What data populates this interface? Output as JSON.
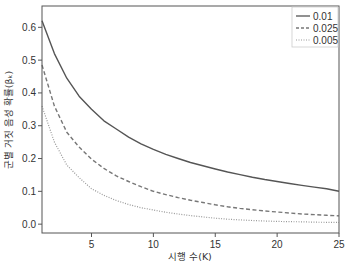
{
  "chart_data": {
    "type": "line",
    "title": "",
    "xlabel": "시행 수(K)",
    "ylabel": "군별 거짓 음성 확률(βₖ)",
    "xlim": [
      1,
      25
    ],
    "ylim": [
      -0.027,
      0.665
    ],
    "xticks": [
      5,
      10,
      15,
      20,
      25
    ],
    "yticks": [
      0.0,
      0.1,
      0.2,
      0.3,
      0.4,
      0.5,
      0.6
    ],
    "ytick_labels": [
      "0.0",
      "0.1",
      "0.2",
      "0.3",
      "0.4",
      "0.5",
      "0.6"
    ],
    "grid": false,
    "legend_position": "upper right",
    "x": [
      1,
      2,
      3,
      4,
      5,
      6,
      7,
      8,
      9,
      10,
      11,
      12,
      13,
      14,
      15,
      16,
      17,
      18,
      19,
      20,
      21,
      22,
      23,
      24,
      25
    ],
    "series": [
      {
        "name": "0.01",
        "style": "solid",
        "color": "#555555",
        "values": [
          0.62,
          0.52,
          0.445,
          0.39,
          0.35,
          0.315,
          0.29,
          0.265,
          0.245,
          0.228,
          0.213,
          0.2,
          0.188,
          0.178,
          0.168,
          0.159,
          0.151,
          0.143,
          0.136,
          0.13,
          0.124,
          0.118,
          0.113,
          0.108,
          0.1
        ]
      },
      {
        "name": "0.025",
        "style": "dashed",
        "color": "#777777",
        "values": [
          0.485,
          0.36,
          0.28,
          0.235,
          0.198,
          0.17,
          0.147,
          0.13,
          0.114,
          0.1,
          0.09,
          0.081,
          0.073,
          0.066,
          0.059,
          0.053,
          0.048,
          0.044,
          0.04,
          0.037,
          0.034,
          0.031,
          0.029,
          0.027,
          0.025
        ]
      },
      {
        "name": "0.005",
        "style": "dotted",
        "color": "#999999",
        "values": [
          0.36,
          0.25,
          0.18,
          0.142,
          0.108,
          0.088,
          0.072,
          0.06,
          0.05,
          0.043,
          0.036,
          0.031,
          0.026,
          0.022,
          0.018,
          0.015,
          0.013,
          0.011,
          0.0095,
          0.0085,
          0.0075,
          0.007,
          0.006,
          0.0055,
          0.005
        ]
      }
    ]
  }
}
